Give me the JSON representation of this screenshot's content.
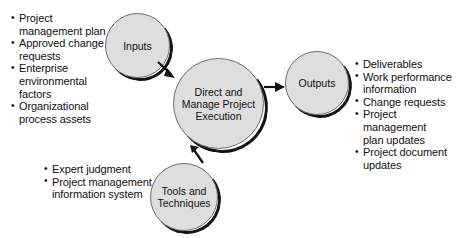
{
  "diagram": {
    "accent_fill": "#dedede",
    "stroke": "#6d6d6d",
    "shadow": "#151515",
    "nodes": {
      "inputs": {
        "label": "Inputs"
      },
      "center": {
        "label": "Direct and\nManage Project\nExecution"
      },
      "outputs": {
        "label": "Outputs"
      },
      "tools": {
        "label": "Tools and\nTechniques"
      }
    },
    "inputs_list": [
      "Project\nmanagement plan",
      "Approved change\nrequests",
      "Enterprise\nenvironmental\nfactors",
      "Organizational\nprocess assets"
    ],
    "tools_list": [
      "Expert judgment",
      "Project management\ninformation system"
    ],
    "outputs_list": [
      "Deliverables",
      "Work performance\ninformation",
      "Change requests",
      "Project management\nplan updates",
      "Project document\nupdates"
    ]
  }
}
